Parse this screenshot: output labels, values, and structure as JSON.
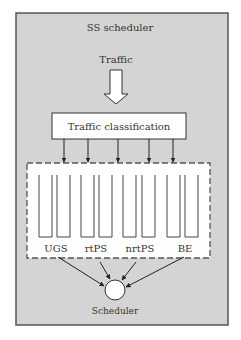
{
  "diagram": {
    "title": "SS scheduler",
    "input_label": "Traffic",
    "classifier_label": "Traffic classification",
    "service_classes": [
      {
        "label": "UGS",
        "queues": 2
      },
      {
        "label": "rtPS",
        "queues": 2
      },
      {
        "label": "nrtPS",
        "queues": 2
      },
      {
        "label": "BE",
        "queues": 2
      }
    ],
    "scheduler_label": "Scheduler",
    "classifier_outputs": 5,
    "colors": {
      "panel_bg": "#d4d4d4",
      "panel_border": "#555555",
      "box_fill": "#ffffff",
      "stroke": "#333333"
    }
  }
}
